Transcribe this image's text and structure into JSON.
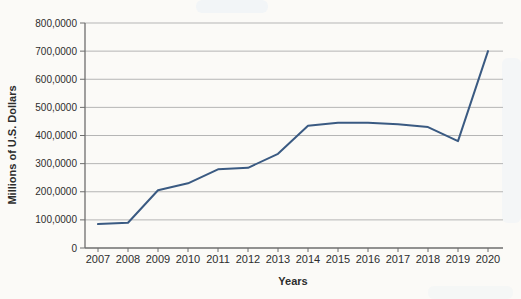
{
  "page": {
    "background": "#fbfaf7"
  },
  "chart_data": {
    "type": "line",
    "categories": [
      "2007",
      "2008",
      "2009",
      "2010",
      "2011",
      "2012",
      "2013",
      "2014",
      "2015",
      "2016",
      "2017",
      "2018",
      "2019",
      "2020"
    ],
    "values": [
      85000,
      90000,
      205000,
      230000,
      280000,
      285000,
      335000,
      435000,
      445000,
      445000,
      440000,
      430000,
      380000,
      700000
    ],
    "xlabel": "Years",
    "ylabel": "Millions of U.S. Dollars",
    "ylim": [
      0,
      800000
    ],
    "ytick_step": 100000,
    "ytick_labels": [
      "0",
      "100,0000",
      "200,0000",
      "300,0000",
      "400,0000",
      "500,0000",
      "600,0000",
      "700,0000",
      "800,0000"
    ],
    "grid": true,
    "legend": "none",
    "line_color": "#3a5a82",
    "grid_color": "#b5b5b5",
    "axis_color": "#6e6e6e",
    "text_color": "#2d2d2d"
  }
}
